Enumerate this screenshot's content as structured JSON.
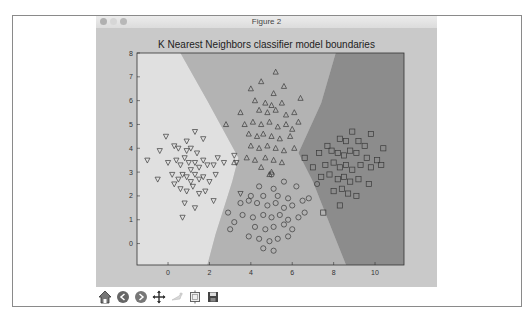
{
  "window": {
    "title": "Figure 2",
    "traffic_lights": [
      "close",
      "minimize",
      "zoom"
    ]
  },
  "toolbar": {
    "buttons": [
      {
        "name": "home",
        "icon": "home-icon"
      },
      {
        "name": "back",
        "icon": "back-arrow-icon"
      },
      {
        "name": "forward",
        "icon": "forward-arrow-icon"
      },
      {
        "name": "pan",
        "icon": "pan-move-icon"
      },
      {
        "name": "zoom",
        "icon": "zoom-rect-icon"
      },
      {
        "name": "subplots",
        "icon": "subplots-config-icon"
      },
      {
        "name": "save",
        "icon": "save-floppy-icon"
      }
    ]
  },
  "colors": {
    "figure_bg": "#c9c9c9",
    "region_left": "#e0e0e0",
    "region_middle": "#b3b3b3",
    "region_right": "#8c8c8c",
    "marker_stroke": "#3a3a3a"
  },
  "chart_data": {
    "type": "scatter",
    "title": "K Nearest Neighbors classifier model boundaries",
    "xlabel": "",
    "ylabel": "",
    "xlim": [
      -1.5,
      11.4
    ],
    "ylim": [
      -0.9,
      8
    ],
    "xticks": [
      0,
      2,
      4,
      6,
      8,
      10
    ],
    "yticks": [
      0,
      1,
      2,
      3,
      4,
      5,
      6,
      7,
      8
    ],
    "grid": false,
    "legend": null,
    "decision_regions": [
      {
        "class": "down-triangle",
        "shade": "light",
        "boundary_polygon": [
          [
            -1.5,
            8
          ],
          [
            0.6,
            8
          ],
          [
            1.9,
            6.0
          ],
          [
            3.4,
            3.6
          ],
          [
            3.1,
            2.6
          ],
          [
            2.3,
            0.4
          ],
          [
            1.9,
            -0.9
          ],
          [
            -1.5,
            -0.9
          ]
        ]
      },
      {
        "class": "up-triangle / circle",
        "shade": "medium",
        "boundary_polygon": [
          [
            0.6,
            8
          ],
          [
            8.1,
            8
          ],
          [
            7.4,
            5.9
          ],
          [
            6.3,
            3.8
          ],
          [
            7.0,
            2.6
          ],
          [
            8.0,
            0.4
          ],
          [
            8.6,
            -0.9
          ],
          [
            1.9,
            -0.9
          ],
          [
            2.3,
            0.4
          ],
          [
            3.1,
            2.6
          ],
          [
            3.4,
            3.6
          ],
          [
            1.9,
            6.0
          ]
        ]
      },
      {
        "class": "square",
        "shade": "dark",
        "boundary_polygon": [
          [
            8.1,
            8
          ],
          [
            11.4,
            8
          ],
          [
            11.4,
            -0.9
          ],
          [
            8.6,
            -0.9
          ],
          [
            8.0,
            0.4
          ],
          [
            7.0,
            2.6
          ],
          [
            6.3,
            3.8
          ],
          [
            7.4,
            5.9
          ]
        ]
      }
    ],
    "series": [
      {
        "name": "class_down_triangle",
        "marker": "v",
        "center": [
          1.0,
          3.2
        ],
        "approx_count": 100,
        "points": [
          [
            -0.4,
            3.9
          ],
          [
            -0.1,
            4.5
          ],
          [
            0.3,
            4.1
          ],
          [
            0.9,
            4.3
          ],
          [
            0.5,
            4.0
          ],
          [
            1.3,
            4.7
          ],
          [
            1.7,
            4.4
          ],
          [
            0.0,
            3.4
          ],
          [
            0.4,
            3.5
          ],
          [
            0.6,
            3.3
          ],
          [
            0.8,
            3.6
          ],
          [
            1.0,
            3.4
          ],
          [
            1.1,
            3.1
          ],
          [
            1.3,
            3.4
          ],
          [
            1.5,
            3.2
          ],
          [
            1.7,
            3.5
          ],
          [
            1.9,
            3.3
          ],
          [
            2.2,
            3.3
          ],
          [
            2.4,
            3.6
          ],
          [
            2.7,
            3.4
          ],
          [
            3.2,
            3.7
          ],
          [
            3.3,
            3.4
          ],
          [
            0.2,
            2.9
          ],
          [
            0.5,
            2.7
          ],
          [
            0.7,
            2.9
          ],
          [
            0.9,
            2.8
          ],
          [
            1.1,
            2.6
          ],
          [
            1.3,
            2.9
          ],
          [
            1.5,
            2.7
          ],
          [
            1.7,
            2.8
          ],
          [
            2.0,
            2.6
          ],
          [
            2.3,
            2.9
          ],
          [
            0.6,
            2.3
          ],
          [
            0.9,
            2.2
          ],
          [
            1.2,
            2.4
          ],
          [
            1.5,
            2.1
          ],
          [
            1.8,
            2.2
          ],
          [
            0.3,
            2.5
          ],
          [
            -0.5,
            2.7
          ],
          [
            -1.0,
            3.5
          ],
          [
            0.8,
            1.7
          ],
          [
            1.3,
            1.5
          ],
          [
            2.2,
            1.8
          ],
          [
            3.5,
            2.1
          ],
          [
            0.7,
            1.1
          ],
          [
            1.1,
            4.0
          ],
          [
            1.4,
            3.8
          ],
          [
            0.9,
            3.9
          ]
        ]
      },
      {
        "name": "class_up_triangle",
        "marker": "^",
        "center": [
          4.8,
          5.4
        ],
        "approx_count": 100,
        "points": [
          [
            5.2,
            7.2
          ],
          [
            4.5,
            6.8
          ],
          [
            5.6,
            6.6
          ],
          [
            4.0,
            6.5
          ],
          [
            5.1,
            6.3
          ],
          [
            6.4,
            6.1
          ],
          [
            4.2,
            6.0
          ],
          [
            4.7,
            5.9
          ],
          [
            5.0,
            5.8
          ],
          [
            5.5,
            5.9
          ],
          [
            3.5,
            5.5
          ],
          [
            4.4,
            5.6
          ],
          [
            4.8,
            5.5
          ],
          [
            5.2,
            5.6
          ],
          [
            5.7,
            5.4
          ],
          [
            6.1,
            5.5
          ],
          [
            2.8,
            5.0
          ],
          [
            3.7,
            5.0
          ],
          [
            4.1,
            5.1
          ],
          [
            4.5,
            5.0
          ],
          [
            4.9,
            5.1
          ],
          [
            5.3,
            4.9
          ],
          [
            5.7,
            5.0
          ],
          [
            6.0,
            4.8
          ],
          [
            6.3,
            5.1
          ],
          [
            3.9,
            4.6
          ],
          [
            4.3,
            4.5
          ],
          [
            4.6,
            4.6
          ],
          [
            5.0,
            4.5
          ],
          [
            5.4,
            4.4
          ],
          [
            5.9,
            4.5
          ],
          [
            4.0,
            4.1
          ],
          [
            4.4,
            4.0
          ],
          [
            4.8,
            4.1
          ],
          [
            5.2,
            4.0
          ],
          [
            5.6,
            3.9
          ],
          [
            6.1,
            4.0
          ],
          [
            3.8,
            3.6
          ],
          [
            4.2,
            3.5
          ],
          [
            4.7,
            3.6
          ],
          [
            5.1,
            3.5
          ],
          [
            5.5,
            3.4
          ],
          [
            3.2,
            3.4
          ],
          [
            4.5,
            3.2
          ],
          [
            5.0,
            3.0
          ],
          [
            4.9,
            2.9
          ]
        ]
      },
      {
        "name": "class_circle",
        "marker": "o",
        "center": [
          5.0,
          1.5
        ],
        "approx_count": 100,
        "points": [
          [
            5.0,
            2.9
          ],
          [
            5.6,
            2.6
          ],
          [
            4.4,
            2.4
          ],
          [
            5.1,
            2.3
          ],
          [
            6.2,
            2.4
          ],
          [
            4.0,
            2.0
          ],
          [
            4.6,
            2.0
          ],
          [
            5.3,
            2.0
          ],
          [
            5.8,
            1.9
          ],
          [
            6.5,
            1.8
          ],
          [
            3.5,
            1.7
          ],
          [
            3.9,
            1.8
          ],
          [
            4.3,
            1.7
          ],
          [
            4.8,
            1.6
          ],
          [
            5.2,
            1.7
          ],
          [
            5.6,
            1.5
          ],
          [
            6.0,
            1.6
          ],
          [
            6.8,
            1.9
          ],
          [
            3.6,
            1.2
          ],
          [
            4.1,
            1.1
          ],
          [
            4.6,
            1.2
          ],
          [
            5.0,
            1.1
          ],
          [
            5.4,
            1.2
          ],
          [
            5.8,
            1.0
          ],
          [
            6.3,
            1.1
          ],
          [
            3.2,
            0.9
          ],
          [
            4.2,
            0.7
          ],
          [
            4.7,
            0.6
          ],
          [
            5.1,
            0.7
          ],
          [
            5.6,
            0.8
          ],
          [
            6.0,
            0.6
          ],
          [
            3.9,
            0.3
          ],
          [
            4.4,
            0.2
          ],
          [
            4.9,
            0.1
          ],
          [
            5.3,
            0.2
          ],
          [
            5.8,
            0.3
          ],
          [
            4.6,
            -0.2
          ],
          [
            5.1,
            -0.3
          ],
          [
            2.9,
            1.3
          ],
          [
            3.0,
            0.6
          ],
          [
            6.6,
            1.3
          ],
          [
            7.2,
            2.5
          ]
        ]
      },
      {
        "name": "class_square",
        "marker": "s",
        "center": [
          8.5,
          3.3
        ],
        "approx_count": 100,
        "points": [
          [
            9.8,
            4.6
          ],
          [
            7.7,
            4.1
          ],
          [
            8.3,
            4.4
          ],
          [
            8.6,
            4.3
          ],
          [
            9.2,
            4.3
          ],
          [
            9.5,
            4.1
          ],
          [
            7.3,
            3.8
          ],
          [
            7.9,
            3.9
          ],
          [
            8.2,
            3.8
          ],
          [
            8.5,
            3.7
          ],
          [
            8.8,
            3.9
          ],
          [
            9.1,
            3.8
          ],
          [
            9.6,
            3.6
          ],
          [
            10.1,
            3.5
          ],
          [
            10.3,
            3.3
          ],
          [
            7.6,
            3.3
          ],
          [
            8.0,
            3.4
          ],
          [
            8.3,
            3.2
          ],
          [
            8.6,
            3.3
          ],
          [
            8.9,
            3.1
          ],
          [
            9.3,
            3.3
          ],
          [
            9.8,
            3.2
          ],
          [
            7.4,
            2.8
          ],
          [
            7.8,
            2.9
          ],
          [
            8.2,
            2.7
          ],
          [
            8.5,
            2.8
          ],
          [
            8.8,
            2.6
          ],
          [
            9.2,
            2.7
          ],
          [
            9.7,
            2.5
          ],
          [
            8.0,
            2.2
          ],
          [
            8.4,
            2.3
          ],
          [
            8.7,
            2.1
          ],
          [
            9.1,
            2.0
          ],
          [
            8.3,
            1.6
          ],
          [
            7.5,
            1.3
          ],
          [
            10.4,
            4.0
          ],
          [
            6.6,
            3.6
          ],
          [
            7.0,
            3.2
          ],
          [
            8.9,
            4.7
          ]
        ]
      }
    ]
  }
}
